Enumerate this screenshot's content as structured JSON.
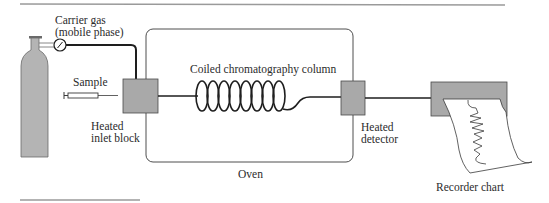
{
  "diagram": {
    "labels": {
      "carrier_gas_line1": "Carrier gas",
      "carrier_gas_line2": "(mobile phase)",
      "sample": "Sample",
      "inlet_line1": "Heated",
      "inlet_line2": "inlet block",
      "column": "Coiled chromatography column",
      "oven": "Oven",
      "detector_line1": "Heated",
      "detector_line2": "detector",
      "recorder": "Recorder chart"
    },
    "components": [
      {
        "id": "gas-cylinder",
        "icon": "gas-cylinder-icon"
      },
      {
        "id": "pressure-gauge",
        "icon": "pressure-gauge-icon"
      },
      {
        "id": "syringe",
        "icon": "syringe-icon"
      },
      {
        "id": "inlet-block",
        "icon": "heated-block-icon"
      },
      {
        "id": "oven",
        "icon": "oven-enclosure"
      },
      {
        "id": "column",
        "icon": "coil-icon"
      },
      {
        "id": "detector",
        "icon": "heated-block-icon"
      },
      {
        "id": "recorder",
        "icon": "chart-recorder-icon"
      }
    ],
    "colors": {
      "block_fill": "#a9a9a9",
      "cylinder_fill": "#b4b4b4",
      "line": "#1e1e1e",
      "rule": "#9a9a9a"
    }
  }
}
